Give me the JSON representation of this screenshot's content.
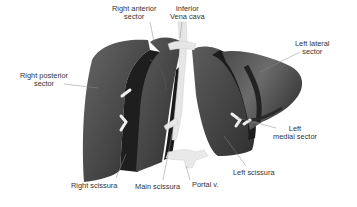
{
  "diagram": {
    "labels": {
      "right_anterior_sector": {
        "line1": "Right anterior",
        "line2": "sector"
      },
      "inferior_vena_cava": {
        "line1": "Inferior",
        "line2": "Vena cava"
      },
      "left_lateral_sector": {
        "line1": "Left lateral",
        "line2": "sector"
      },
      "right_posterior_sector": {
        "line1": "Right posterior",
        "line2": "sector"
      },
      "left_medial_sector": {
        "line1": "Left",
        "line2": "medial sector"
      },
      "left_scissura": "Left scissura",
      "right_scissura": "Right scissura",
      "main_scissura": "Main scissura",
      "portal_vein": "Portal v."
    },
    "colors": {
      "background": "#ffffff",
      "organ_dark": "#2e2e2e",
      "organ_mid": "#4a4a4a",
      "organ_light": "#6a6a6a",
      "vessel": "#e8e8e8",
      "leader_line": "#888888",
      "text": "#333333"
    }
  }
}
